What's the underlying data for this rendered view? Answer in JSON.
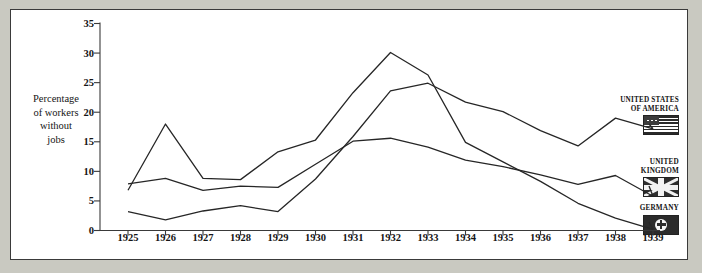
{
  "chart_data": {
    "type": "line",
    "title": "",
    "subtitle": "",
    "xlabel": "",
    "ylabel": "Percentage of workers without jobs",
    "categories": [
      "1925",
      "1926",
      "1927",
      "1928",
      "1929",
      "1930",
      "1931",
      "1932",
      "1933",
      "1934",
      "1935",
      "1936",
      "1937",
      "1938",
      "1939"
    ],
    "x": [
      1925,
      1926,
      1927,
      1928,
      1929,
      1930,
      1931,
      1932,
      1933,
      1934,
      1935,
      1936,
      1937,
      1938,
      1939
    ],
    "ylim": [
      0,
      35
    ],
    "yticks": [
      0,
      5,
      10,
      15,
      20,
      25,
      30,
      35
    ],
    "grid": false,
    "legend_position": "right",
    "series": [
      {
        "name": "GERMANY",
        "values": [
          6.8,
          18.0,
          8.8,
          8.6,
          13.3,
          15.3,
          23.3,
          30.1,
          26.3,
          14.9,
          11.6,
          8.3,
          4.6,
          2.1,
          0.2
        ]
      },
      {
        "name": "UNITED KINGDOM",
        "values": [
          7.9,
          8.8,
          6.8,
          7.5,
          7.3,
          11.2,
          15.1,
          15.6,
          14.1,
          11.9,
          10.8,
          9.4,
          7.8,
          9.3,
          5.8
        ]
      },
      {
        "name": "UNITED STATES OF AMERICA",
        "values": [
          3.2,
          1.8,
          3.3,
          4.2,
          3.2,
          8.7,
          15.9,
          23.6,
          24.9,
          21.7,
          20.1,
          16.9,
          14.3,
          19.0,
          17.2
        ]
      }
    ]
  },
  "axis": {
    "y_title_lines": [
      "Percentage",
      "of workers",
      "without",
      "jobs"
    ],
    "y_tick_labels": [
      "0",
      "5",
      "10",
      "15",
      "20",
      "25",
      "30",
      "35"
    ],
    "x_tick_labels": [
      "1925",
      "1926",
      "1927",
      "1928",
      "1929",
      "1930",
      "1931",
      "1932",
      "1933",
      "1934",
      "1935",
      "1936",
      "1937",
      "1938",
      "1939"
    ]
  },
  "legend": {
    "entries": [
      {
        "label_lines": [
          "UNITED STATES",
          "OF AMERICA"
        ],
        "flag": "flag-usa-icon"
      },
      {
        "label_lines": [
          "UNITED",
          "KINGDOM"
        ],
        "flag": "flag-uk-icon"
      },
      {
        "label_lines": [
          "GERMANY"
        ],
        "flag": "flag-germany-icon"
      }
    ]
  },
  "style": {
    "line_color": "#262626",
    "axis_color": "#3a3a3a",
    "page_background": "#c9c9c1",
    "plate_background": "#ffffff"
  }
}
